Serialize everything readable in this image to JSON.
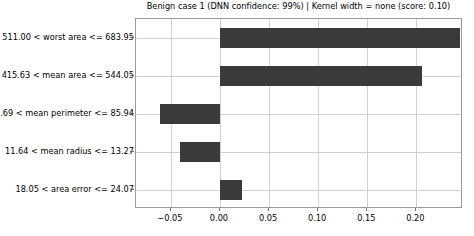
{
  "chart_data": {
    "type": "bar",
    "orientation": "horizontal",
    "title": "Benign case 1 (DNN confidence: 99%) | Kernel width = none (score: 0.10)",
    "xlabel": "",
    "ylabel": "",
    "categories": [
      "511.00 < worst area <= 683.95",
      "415.63 < mean area <= 544.05",
      "74.69 < mean perimeter <= 85.94",
      "11.64 < mean radius <= 13.27",
      "18.05 < area error <= 24.07"
    ],
    "values": [
      0.2445,
      0.2053,
      -0.0614,
      -0.0412,
      0.0221
    ],
    "bar_color": "#3a3a3a",
    "xlim": [
      -0.0855,
      0.2475
    ],
    "xticks": [
      -0.05,
      0.0,
      0.05,
      0.1,
      0.15,
      0.2
    ],
    "xticklabels": [
      "−0.05",
      "0.00",
      "0.05",
      "0.10",
      "0.15",
      "0.20"
    ],
    "grid": true,
    "grid_axis": "both",
    "legend": null,
    "legend_position": "none",
    "annotations": []
  },
  "figure": {
    "background_color": "#ffffff",
    "axes_edge_color": "#9a9a9a",
    "grid_color": "#d0d0d0",
    "tick_color": "#6f6f6f"
  }
}
